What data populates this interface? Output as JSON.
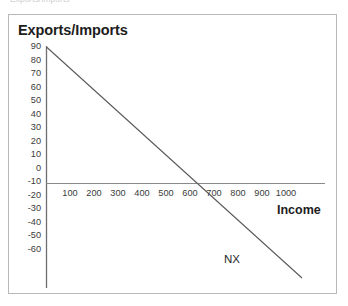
{
  "figure": {
    "top_caption_ghost": "Exports/Imports",
    "frame_color": "#b9b9b9",
    "background": "#ffffff"
  },
  "chart_data": {
    "type": "line",
    "title": "",
    "ylabel": "Exports/Imports",
    "xlabel": "Income",
    "xlim": [
      0,
      1110
    ],
    "ylim": [
      -65,
      95
    ],
    "grid": false,
    "legend": "none",
    "yticks": [
      90,
      80,
      70,
      60,
      50,
      40,
      30,
      20,
      10,
      0,
      -10,
      -20,
      -30,
      -40,
      -50,
      -60
    ],
    "ytick_labels": [
      "90",
      "80",
      "70",
      "60",
      "50",
      "40",
      "30",
      "20",
      "10",
      "0",
      "-10",
      "-20",
      "-30",
      "-40",
      "-50",
      "-60"
    ],
    "xticks": [
      100,
      200,
      300,
      400,
      500,
      600,
      700,
      800,
      900,
      1000
    ],
    "xtick_labels": [
      "100",
      "200",
      "300",
      "400",
      "500",
      "600",
      "700",
      "800",
      "900",
      "1000"
    ],
    "axis_color": "#6b6b6b",
    "series": [
      {
        "name": "NX",
        "label": "NX",
        "color": "#5a5a5a",
        "x": [
          0,
          1070
        ],
        "y": [
          90,
          -60
        ],
        "intercept": 90,
        "slope": -0.1402,
        "x_zero_crossing": 642
      }
    ],
    "annotations": [
      {
        "text": "NX",
        "x": 790,
        "y": -50
      },
      {
        "text": "Income",
        "x": 1010,
        "y": -20
      }
    ]
  }
}
